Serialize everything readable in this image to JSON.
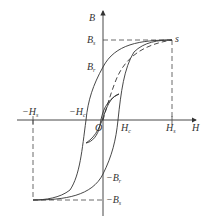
{
  "diagram": {
    "type": "hysteresis-loop",
    "colors": {
      "stroke": "#333333",
      "background": "#ffffff",
      "dash": "#444444"
    },
    "axes": {
      "x_label": "H",
      "y_label": "B",
      "origin_label": "O"
    },
    "labels": {
      "Bs": {
        "main": "B",
        "sub": "s"
      },
      "Br": {
        "main": "B",
        "sub": "r"
      },
      "neg_Br": {
        "main": "−B",
        "sub": "r"
      },
      "neg_Bs": {
        "main": "−B",
        "sub": "s"
      },
      "Hs": {
        "main": "H",
        "sub": "s"
      },
      "Hc": {
        "main": "H",
        "sub": "c"
      },
      "neg_Hs": {
        "main": "−H",
        "sub": "s"
      },
      "neg_Hc": {
        "main": "−H",
        "sub": "c"
      },
      "saturation_point": "s"
    },
    "curves": [
      {
        "name": "major-loop-upper-branch",
        "style": "solid"
      },
      {
        "name": "major-loop-lower-branch",
        "style": "solid"
      },
      {
        "name": "initial-magnetization-curve",
        "style": "dashed"
      },
      {
        "name": "minor-loop",
        "style": "solid"
      }
    ],
    "guides": [
      {
        "name": "Bs-horizontal-dashed",
        "style": "dashed"
      },
      {
        "name": "Hs-vertical-dashed",
        "style": "dashed"
      },
      {
        "name": "neg-Bs-horizontal-dashed",
        "style": "dashed"
      },
      {
        "name": "neg-Hs-vertical-dashed",
        "style": "dashed"
      }
    ]
  }
}
